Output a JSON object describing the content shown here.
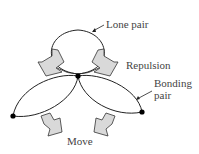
{
  "diagram": {
    "labels": {
      "lone_pair": "Lone pair",
      "repulsion": "Repulsion",
      "bonding_pair_line1": "Bonding",
      "bonding_pair_line2": "pair",
      "move": "Move"
    },
    "colors": {
      "line": "#222222",
      "arrow_fill": "#d9d9d9",
      "dot": "#000000",
      "text": "#444444"
    }
  }
}
